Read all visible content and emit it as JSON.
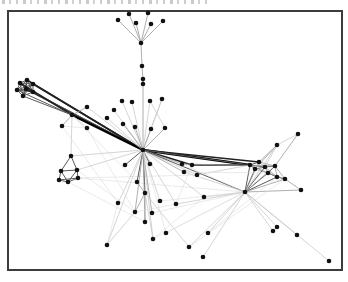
{
  "figure": {
    "type": "node-link-graph",
    "background": "#ffffff",
    "frame": {
      "x": 8,
      "y": 11,
      "width": 334,
      "height": 259,
      "color": "#3c3c3c",
      "stroke_width": 2
    },
    "node_color": "#111111",
    "node_radius": 2.3,
    "edge_styles": {
      "f": {
        "color": "#dcdcdc",
        "width": 0.6
      },
      "l": {
        "color": "#c3c3c3",
        "width": 0.7
      },
      "m": {
        "color": "#9a9a9a",
        "width": 0.8
      },
      "d": {
        "color": "#5a5a5a",
        "width": 1.0
      },
      "b": {
        "color": "#222222",
        "width": 1.5
      },
      "B": {
        "color": "#000000",
        "width": 2.4
      }
    },
    "nodes": [
      [
        129,
        14
      ],
      [
        148,
        13
      ],
      [
        118,
        20
      ],
      [
        136,
        23
      ],
      [
        151,
        24
      ],
      [
        163,
        21
      ],
      [
        141,
        43
      ],
      [
        142,
        66
      ],
      [
        143,
        79
      ],
      [
        143,
        84
      ],
      [
        122,
        101
      ],
      [
        132,
        102
      ],
      [
        150,
        101
      ],
      [
        162,
        99
      ],
      [
        114,
        110
      ],
      [
        107,
        118
      ],
      [
        123,
        124
      ],
      [
        135,
        127
      ],
      [
        151,
        129
      ],
      [
        165,
        128
      ],
      [
        27,
        80
      ],
      [
        20,
        83
      ],
      [
        33,
        84
      ],
      [
        17,
        90
      ],
      [
        26,
        89
      ],
      [
        33,
        92
      ],
      [
        23,
        96
      ],
      [
        87,
        107
      ],
      [
        72,
        115
      ],
      [
        62,
        126
      ],
      [
        87,
        128
      ],
      [
        71,
        156
      ],
      [
        61,
        171
      ],
      [
        77,
        170
      ],
      [
        59,
        180
      ],
      [
        68,
        182
      ],
      [
        78,
        178
      ],
      [
        143,
        150
      ],
      [
        125,
        165
      ],
      [
        150,
        164
      ],
      [
        137,
        182
      ],
      [
        145,
        193
      ],
      [
        118,
        203
      ],
      [
        135,
        212
      ],
      [
        152,
        213
      ],
      [
        145,
        222
      ],
      [
        153,
        239
      ],
      [
        107,
        245
      ],
      [
        166,
        233
      ],
      [
        189,
        247
      ],
      [
        160,
        201
      ],
      [
        182,
        164
      ],
      [
        192,
        165
      ],
      [
        184,
        172
      ],
      [
        197,
        175
      ],
      [
        176,
        204
      ],
      [
        204,
        197
      ],
      [
        259,
        162
      ],
      [
        250,
        165
      ],
      [
        255,
        169
      ],
      [
        265,
        167
      ],
      [
        275,
        166
      ],
      [
        268,
        173
      ],
      [
        277,
        177
      ],
      [
        285,
        179
      ],
      [
        277,
        145
      ],
      [
        298,
        134
      ],
      [
        301,
        190
      ],
      [
        245,
        192
      ],
      [
        208,
        233
      ],
      [
        273,
        231
      ],
      [
        277,
        227
      ],
      [
        297,
        235
      ],
      [
        203,
        257
      ],
      [
        329,
        261
      ]
    ],
    "edges": [
      [
        0,
        6,
        "m"
      ],
      [
        1,
        6,
        "m"
      ],
      [
        2,
        6,
        "m"
      ],
      [
        3,
        6,
        "m"
      ],
      [
        4,
        6,
        "m"
      ],
      [
        5,
        6,
        "m"
      ],
      [
        6,
        7,
        "m"
      ],
      [
        7,
        8,
        "m"
      ],
      [
        8,
        9,
        "d"
      ],
      [
        9,
        37,
        "m"
      ],
      [
        10,
        37,
        "l"
      ],
      [
        11,
        37,
        "l"
      ],
      [
        12,
        37,
        "l"
      ],
      [
        13,
        37,
        "l"
      ],
      [
        14,
        37,
        "l"
      ],
      [
        15,
        37,
        "l"
      ],
      [
        16,
        37,
        "m"
      ],
      [
        17,
        37,
        "m"
      ],
      [
        18,
        37,
        "m"
      ],
      [
        19,
        37,
        "m"
      ],
      [
        12,
        19,
        "l"
      ],
      [
        13,
        18,
        "l"
      ],
      [
        20,
        21,
        "d"
      ],
      [
        20,
        22,
        "d"
      ],
      [
        20,
        23,
        "d"
      ],
      [
        20,
        24,
        "d"
      ],
      [
        20,
        25,
        "d"
      ],
      [
        20,
        26,
        "d"
      ],
      [
        21,
        22,
        "d"
      ],
      [
        21,
        23,
        "d"
      ],
      [
        21,
        24,
        "d"
      ],
      [
        21,
        25,
        "d"
      ],
      [
        21,
        26,
        "d"
      ],
      [
        22,
        23,
        "d"
      ],
      [
        22,
        24,
        "d"
      ],
      [
        22,
        25,
        "d"
      ],
      [
        22,
        26,
        "d"
      ],
      [
        23,
        24,
        "d"
      ],
      [
        23,
        25,
        "d"
      ],
      [
        23,
        26,
        "d"
      ],
      [
        24,
        25,
        "d"
      ],
      [
        24,
        26,
        "d"
      ],
      [
        25,
        26,
        "d"
      ],
      [
        20,
        37,
        "b"
      ],
      [
        22,
        37,
        "b"
      ],
      [
        24,
        37,
        "b"
      ],
      [
        25,
        37,
        "d"
      ],
      [
        21,
        28,
        "b"
      ],
      [
        23,
        28,
        "d"
      ],
      [
        26,
        28,
        "d"
      ],
      [
        28,
        37,
        "B"
      ],
      [
        28,
        27,
        "m"
      ],
      [
        28,
        29,
        "m"
      ],
      [
        28,
        30,
        "l"
      ],
      [
        28,
        31,
        "l"
      ],
      [
        27,
        37,
        "l"
      ],
      [
        29,
        30,
        "f"
      ],
      [
        28,
        40,
        "f"
      ],
      [
        31,
        32,
        "d"
      ],
      [
        31,
        33,
        "d"
      ],
      [
        32,
        33,
        "d"
      ],
      [
        32,
        34,
        "d"
      ],
      [
        32,
        35,
        "d"
      ],
      [
        33,
        35,
        "d"
      ],
      [
        33,
        36,
        "d"
      ],
      [
        34,
        35,
        "d"
      ],
      [
        35,
        36,
        "d"
      ],
      [
        34,
        36,
        "d"
      ],
      [
        31,
        37,
        "l"
      ],
      [
        33,
        37,
        "l"
      ],
      [
        36,
        54,
        "f"
      ],
      [
        33,
        43,
        "f"
      ],
      [
        35,
        45,
        "f"
      ],
      [
        36,
        68,
        "f"
      ],
      [
        37,
        58,
        "B"
      ],
      [
        37,
        57,
        "b"
      ],
      [
        37,
        60,
        "d"
      ],
      [
        52,
        58,
        "b"
      ],
      [
        37,
        52,
        "b"
      ],
      [
        37,
        38,
        "d"
      ],
      [
        37,
        39,
        "d"
      ],
      [
        37,
        40,
        "d"
      ],
      [
        37,
        41,
        "d"
      ],
      [
        37,
        51,
        "m"
      ],
      [
        37,
        53,
        "m"
      ],
      [
        37,
        54,
        "l"
      ],
      [
        37,
        42,
        "l"
      ],
      [
        37,
        43,
        "m"
      ],
      [
        37,
        44,
        "m"
      ],
      [
        37,
        45,
        "m"
      ],
      [
        37,
        46,
        "l"
      ],
      [
        37,
        47,
        "l"
      ],
      [
        37,
        55,
        "l"
      ],
      [
        37,
        56,
        "l"
      ],
      [
        37,
        50,
        "l"
      ],
      [
        37,
        48,
        "f"
      ],
      [
        37,
        68,
        "d"
      ],
      [
        40,
        41,
        "m"
      ],
      [
        41,
        45,
        "m"
      ],
      [
        41,
        43,
        "m"
      ],
      [
        41,
        49,
        "l"
      ],
      [
        41,
        46,
        "l"
      ],
      [
        43,
        47,
        "l"
      ],
      [
        42,
        47,
        "f"
      ],
      [
        57,
        58,
        "d"
      ],
      [
        57,
        60,
        "m"
      ],
      [
        58,
        59,
        "d"
      ],
      [
        59,
        60,
        "d"
      ],
      [
        60,
        61,
        "d"
      ],
      [
        61,
        62,
        "d"
      ],
      [
        62,
        63,
        "d"
      ],
      [
        63,
        64,
        "d"
      ],
      [
        58,
        62,
        "m"
      ],
      [
        59,
        62,
        "m"
      ],
      [
        60,
        62,
        "m"
      ],
      [
        60,
        63,
        "m"
      ],
      [
        61,
        63,
        "m"
      ],
      [
        61,
        64,
        "m"
      ],
      [
        57,
        61,
        "m"
      ],
      [
        62,
        64,
        "m"
      ],
      [
        65,
        57,
        "m"
      ],
      [
        65,
        59,
        "m"
      ],
      [
        65,
        60,
        "l"
      ],
      [
        66,
        61,
        "m"
      ],
      [
        66,
        65,
        "l"
      ],
      [
        67,
        64,
        "m"
      ],
      [
        67,
        68,
        "m"
      ],
      [
        68,
        58,
        "d"
      ],
      [
        68,
        59,
        "d"
      ],
      [
        68,
        60,
        "d"
      ],
      [
        68,
        62,
        "d"
      ],
      [
        68,
        63,
        "d"
      ],
      [
        68,
        61,
        "m"
      ],
      [
        68,
        57,
        "m"
      ],
      [
        68,
        64,
        "m"
      ],
      [
        68,
        65,
        "l"
      ],
      [
        68,
        69,
        "l"
      ],
      [
        68,
        70,
        "l"
      ],
      [
        68,
        71,
        "l"
      ],
      [
        68,
        72,
        "l"
      ],
      [
        68,
        73,
        "l"
      ],
      [
        68,
        74,
        "l"
      ],
      [
        68,
        55,
        "l"
      ],
      [
        68,
        56,
        "l"
      ],
      [
        68,
        49,
        "l"
      ],
      [
        68,
        44,
        "f"
      ],
      [
        68,
        46,
        "f"
      ],
      [
        68,
        48,
        "f"
      ],
      [
        68,
        53,
        "l"
      ],
      [
        68,
        51,
        "f"
      ],
      [
        70,
        71,
        "m"
      ],
      [
        55,
        43,
        "f"
      ],
      [
        56,
        46,
        "f"
      ],
      [
        52,
        55,
        "f"
      ],
      [
        64,
        49,
        "f"
      ],
      [
        63,
        69,
        "f"
      ],
      [
        54,
        58,
        "l"
      ],
      [
        53,
        62,
        "f"
      ],
      [
        30,
        43,
        "f"
      ],
      [
        29,
        42,
        "f"
      ],
      [
        51,
        61,
        "m"
      ],
      [
        50,
        68,
        "f"
      ]
    ]
  }
}
